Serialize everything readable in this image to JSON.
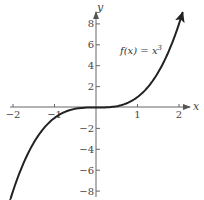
{
  "chart_data": {
    "type": "line",
    "title": "",
    "function_label": "f(x) = x³",
    "xlabel": "x",
    "ylabel": "y",
    "xlim": [
      -2,
      2
    ],
    "ylim": [
      -8,
      8
    ],
    "x_ticks": [
      -2,
      -1,
      1,
      2
    ],
    "x_tick_labels": [
      "−2",
      "−1",
      "1",
      "2"
    ],
    "y_ticks": [
      8,
      6,
      4,
      2,
      -2,
      -4,
      -6,
      -8
    ],
    "y_tick_labels": [
      "8",
      "6",
      "4",
      "2",
      "−2",
      "−4",
      "−6",
      "−8"
    ],
    "grid": false,
    "series": [
      {
        "name": "f(x) = x³",
        "x": [
          -2.05,
          -1.5,
          -1,
          -0.5,
          0,
          0.5,
          1,
          1.5,
          2.08
        ],
        "y": [
          -8.6,
          -3.375,
          -1,
          -0.125,
          0,
          0.125,
          1,
          3.375,
          9.0
        ]
      }
    ],
    "arrows": "curve has arrowheads at both ends; axes have arrowheads at positive ends",
    "colors": {
      "curve": "#222222",
      "axis": "#555555",
      "text": "#444444"
    }
  },
  "labels": {
    "x_axis": "x",
    "y_axis": "y",
    "function": "f(x) = x",
    "function_exp": "3"
  }
}
